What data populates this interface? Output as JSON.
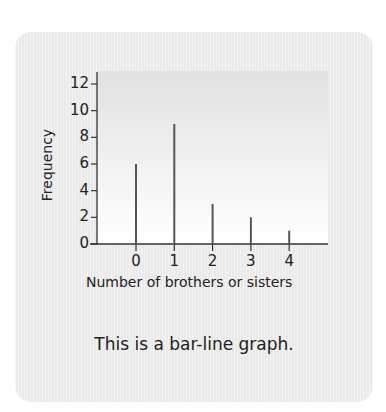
{
  "caption": "This is a bar-line graph.",
  "chart_data": {
    "type": "bar",
    "subtype": "bar-line",
    "title": "",
    "xlabel": "Number of brothers or sisters",
    "ylabel": "Frequency",
    "categories": [
      "0",
      "1",
      "2",
      "3",
      "4"
    ],
    "values": [
      6,
      9,
      3,
      2,
      1
    ],
    "ylim": [
      0,
      12
    ],
    "yticks": [
      "0",
      "2",
      "4",
      "6",
      "8",
      "10",
      "12"
    ],
    "grid": false,
    "legend": null
  },
  "colors": {
    "bar": "#555555",
    "axis": "#333333",
    "card": "#ededed"
  }
}
